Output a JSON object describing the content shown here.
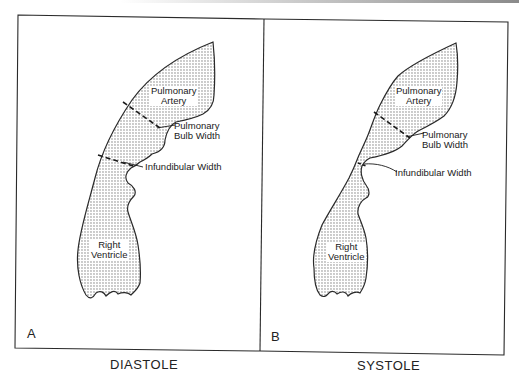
{
  "figure": {
    "panels": [
      {
        "letter": "A",
        "caption": "DIASTOLE",
        "labels": {
          "pulmonary_artery_1": "Pulmonary",
          "pulmonary_artery_2": "Artery",
          "bulb_width_1": "Pulmonary",
          "bulb_width_2": "Bulb Width",
          "infundibular_width": "Infundibular Width",
          "right_ventricle_1": "Right",
          "right_ventricle_2": "Ventricle"
        }
      },
      {
        "letter": "B",
        "caption": "SYSTOLE",
        "labels": {
          "pulmonary_artery_1": "Pulmonary",
          "pulmonary_artery_2": "Artery",
          "bulb_width_1": "Pulmonary",
          "bulb_width_2": "Bulb Width",
          "infundibular_width": "Infundibular Width",
          "right_ventricle_1": "Right",
          "right_ventricle_2": "Ventricle"
        }
      }
    ],
    "colors": {
      "line": "#2a2a2a",
      "stipple": "#6e6e6e",
      "background": "#ffffff"
    }
  }
}
